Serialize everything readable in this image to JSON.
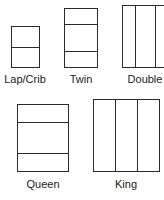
{
  "sizes": [
    {
      "label": "Lap/Crib"
    },
    {
      "label": "Twin"
    },
    {
      "label": "Double"
    },
    {
      "label": "Queen"
    },
    {
      "label": "King"
    }
  ],
  "colors": {
    "line": "#2a2a2a",
    "background": "#ffffff",
    "text": "#222222"
  }
}
